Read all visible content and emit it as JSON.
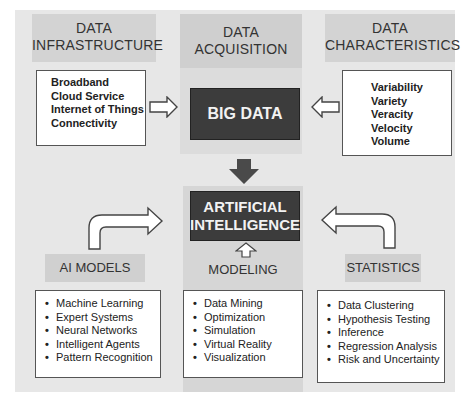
{
  "diagram": {
    "top": {
      "infrastructure": {
        "title_line1": "DATA",
        "title_line2": "INFRASTRUCTURE",
        "items": [
          "Broadband",
          "Cloud Service",
          "Internet of Things",
          "Connectivity"
        ]
      },
      "acquisition": {
        "title_line1": "DATA",
        "title_line2": "ACQUISITION",
        "core": "BIG DATA"
      },
      "characteristics": {
        "title_line1": "DATA",
        "title_line2": "CHARACTERISTICS",
        "items": [
          "Variability",
          "Variety",
          "Veracity",
          "Velocity",
          "Volume"
        ]
      }
    },
    "center": {
      "core_line1": "ARTIFICIAL",
      "core_line2": "INTELLIGENCE"
    },
    "bottom": {
      "ai_models": {
        "title": "AI MODELS",
        "items": [
          "Machine Learning",
          "Expert Systems",
          "Neural Networks",
          "Intelligent Agents",
          "Pattern Recognition"
        ]
      },
      "modeling": {
        "title": "MODELING",
        "items": [
          "Data Mining",
          "Optimization",
          "Simulation",
          "Virtual Reality",
          "Visualization"
        ]
      },
      "statistics": {
        "title": "STATISTICS",
        "items": [
          "Data Clustering",
          "Hypothesis Testing",
          "Inference",
          "Regression Analysis",
          "Risk and Uncertainty"
        ]
      }
    },
    "colors": {
      "panel": "#e7e7e7",
      "band": "#d3d3d3",
      "core_box": "#3c3c3c",
      "arrow_fill": "#555555"
    }
  }
}
